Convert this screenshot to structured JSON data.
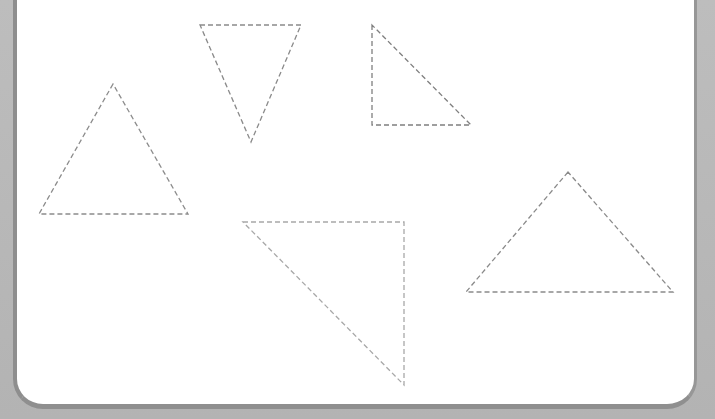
{
  "worksheet": {
    "title": "",
    "stroke_color": "#8a8a8a",
    "stroke_color_light": "#a9a9a9",
    "triangles": [
      {
        "id": "upright-isosceles-left",
        "points": "113,84 39,214 188,214",
        "color": "#8c8c8c"
      },
      {
        "id": "inverted-triangle",
        "points": "200,25 301,25 251,142",
        "color": "#8a8a8a"
      },
      {
        "id": "right-triangle-top",
        "points": "372,25 372,125 471,125",
        "color": "#7f7f7f"
      },
      {
        "id": "right-triangle-bottom",
        "points": "243,222 404,222 404,385",
        "color": "#a8a8a8"
      },
      {
        "id": "obtuse-triangle-right",
        "points": "568,172 466,292 673,292",
        "color": "#8a8a8a"
      }
    ]
  }
}
